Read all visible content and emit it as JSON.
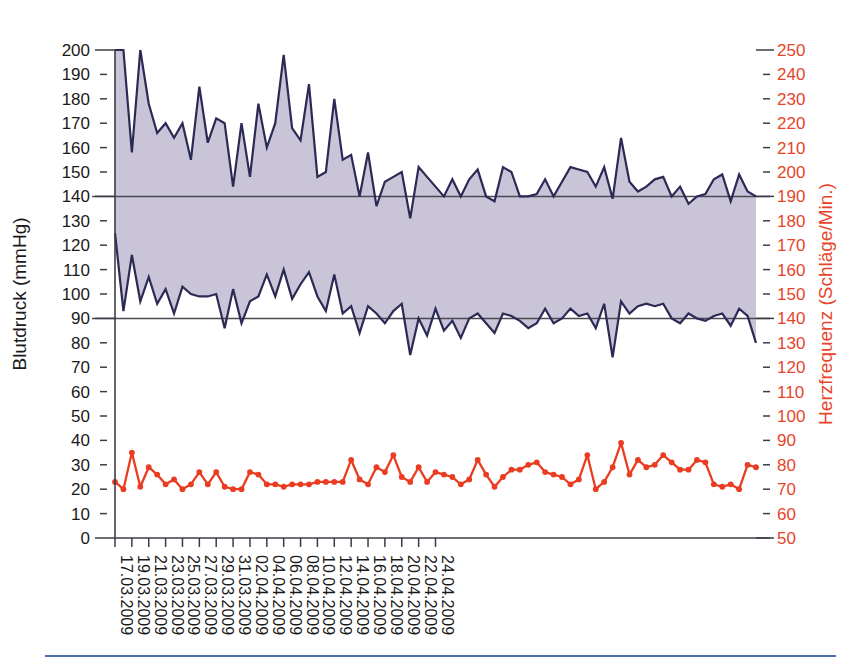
{
  "chart_data": {
    "type": "line",
    "title": "",
    "subtitle": "",
    "xlabel": "",
    "ylabel": "Blutdruck (mmHg)",
    "y2label": "Herzfrequenz (Schläge/Min.)",
    "grid": false,
    "legend": "none",
    "ylim": [
      0,
      200
    ],
    "y2lim": [
      50,
      250
    ],
    "ytick_step": 10,
    "y2tick_step": 10,
    "yticks": [
      0,
      10,
      20,
      30,
      40,
      50,
      60,
      70,
      80,
      90,
      100,
      110,
      120,
      130,
      140,
      150,
      160,
      170,
      180,
      190,
      200
    ],
    "y2ticks": [
      50,
      60,
      70,
      80,
      90,
      100,
      110,
      120,
      130,
      140,
      150,
      160,
      170,
      180,
      190,
      200,
      210,
      220,
      230,
      240,
      250
    ],
    "xtick_labels": [
      "17.03.2009",
      "19.03.2009",
      "21.03.2009",
      "23.03.2009",
      "25.03.2009",
      "27.03.2009",
      "29.03.2009",
      "31.03.2009",
      "02.04.2009",
      "04.04.2009",
      "06.04.2009",
      "08.04.2009",
      "10.04.2009",
      "12.04.2009",
      "14.04.2009",
      "16.04.2009",
      "18.04.2009",
      "20.04.2009",
      "22.04.2009",
      "24.04.2009"
    ],
    "xtick_interval_days": 2,
    "x_start_date": "17.03.2009",
    "x_end_date": "24.04.2009",
    "n_points": 77,
    "reference_lines": [
      {
        "value": 140,
        "axis": "left",
        "label": ""
      },
      {
        "value": 90,
        "axis": "left",
        "label": ""
      }
    ],
    "colors": {
      "band_fill": "#c3bcd4",
      "bp_line": "#2a2a55",
      "hr_line": "#ea3c20",
      "left_axis_text": "#1a1a1a",
      "right_axis_text": "#e8442a",
      "reference_line": "#4a4a52",
      "bottom_rule": "#4a6fae"
    },
    "series": [
      {
        "name": "Systolisch",
        "axis": "left",
        "unit": "mmHg",
        "color": "#2a2a55",
        "values": [
          202,
          200,
          158,
          200,
          178,
          166,
          170,
          164,
          170,
          155,
          185,
          162,
          172,
          170,
          144,
          170,
          148,
          178,
          160,
          170,
          198,
          168,
          163,
          186,
          148,
          150,
          180,
          155,
          157,
          140,
          158,
          136,
          146,
          148,
          150,
          131,
          152,
          148,
          144,
          140,
          147,
          140,
          147,
          151,
          140,
          138,
          152,
          150,
          140,
          140,
          141,
          147,
          140,
          146,
          152,
          151,
          150,
          144,
          152,
          139,
          164,
          146,
          142,
          144,
          147,
          148,
          140,
          144,
          137,
          140,
          141,
          147,
          149,
          138,
          149,
          142,
          140
        ]
      },
      {
        "name": "Diastolisch",
        "axis": "left",
        "unit": "mmHg",
        "color": "#2a2a55",
        "values": [
          125,
          93,
          116,
          97,
          107,
          96,
          102,
          92,
          103,
          100,
          99,
          99,
          100,
          86,
          102,
          88,
          97,
          99,
          108,
          99,
          110,
          98,
          104,
          109,
          99,
          93,
          108,
          92,
          95,
          84,
          95,
          92,
          88,
          93,
          96,
          75,
          90,
          83,
          94,
          85,
          89,
          82,
          90,
          92,
          88,
          84,
          92,
          91,
          89,
          86,
          88,
          94,
          88,
          90,
          94,
          91,
          92,
          86,
          96,
          74,
          97,
          92,
          95,
          96,
          95,
          96,
          90,
          88,
          92,
          90,
          89,
          91,
          92,
          87,
          94,
          91,
          80
        ]
      },
      {
        "name": "Herzfrequenz",
        "axis": "right",
        "unit": "Schläge/Min.",
        "color": "#ea3c20",
        "values": [
          73,
          70,
          85,
          71,
          79,
          76,
          72,
          74,
          70,
          72,
          77,
          72,
          77,
          71,
          70,
          70,
          77,
          76,
          72,
          72,
          71,
          72,
          72,
          72,
          73,
          73,
          73,
          73,
          82,
          74,
          72,
          79,
          77,
          84,
          75,
          73,
          79,
          73,
          77,
          76,
          75,
          72,
          74,
          82,
          76,
          71,
          75,
          78,
          78,
          80,
          81,
          77,
          76,
          75,
          72,
          74,
          84,
          70,
          73,
          79,
          89,
          76,
          82,
          79,
          80,
          84,
          81,
          78,
          78,
          82,
          81,
          72,
          71,
          72,
          70,
          80,
          79
        ]
      }
    ]
  },
  "axes": {
    "left_title": "Blutdruck (mmHg)",
    "right_title": "Herzfrequenz (Schläge/Min.)"
  }
}
